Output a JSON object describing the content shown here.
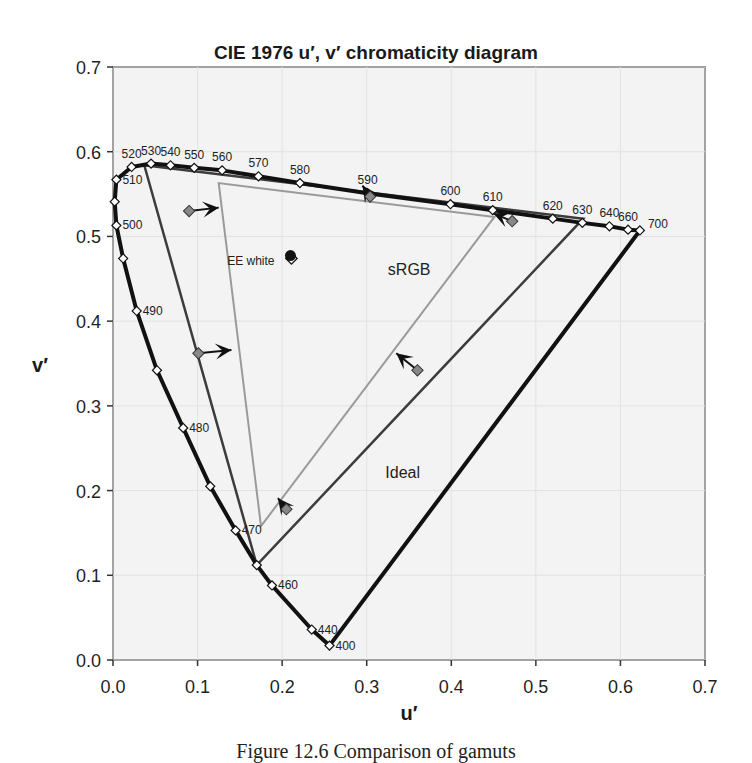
{
  "chart_data": {
    "type": "line",
    "title": "CIE 1976 u′, v′ chromaticity diagram",
    "xlabel": "u′",
    "ylabel": "v′",
    "xlim": [
      0.0,
      0.7
    ],
    "ylim": [
      0.0,
      0.7
    ],
    "x_ticks": [
      "0.0",
      "0.1",
      "0.2",
      "0.3",
      "0.4",
      "0.5",
      "0.6",
      "0.7"
    ],
    "y_ticks": [
      "0.0",
      "0.1",
      "0.2",
      "0.3",
      "0.4",
      "0.5",
      "0.6",
      "0.7"
    ],
    "grid": true,
    "spectral_locus": {
      "name": "Spectral locus",
      "points": [
        {
          "nm": 400,
          "u": 0.256,
          "v": 0.017,
          "label": "400"
        },
        {
          "nm": 440,
          "u": 0.235,
          "v": 0.036,
          "label": "440"
        },
        {
          "nm": 460,
          "u": 0.188,
          "v": 0.088,
          "label": "460"
        },
        {
          "nm": 465,
          "u": 0.17,
          "v": 0.112,
          "label": ""
        },
        {
          "nm": 470,
          "u": 0.145,
          "v": 0.153,
          "label": "470"
        },
        {
          "nm": 475,
          "u": 0.115,
          "v": 0.205,
          "label": ""
        },
        {
          "nm": 480,
          "u": 0.083,
          "v": 0.274,
          "label": "480"
        },
        {
          "nm": 485,
          "u": 0.052,
          "v": 0.342,
          "label": ""
        },
        {
          "nm": 490,
          "u": 0.028,
          "v": 0.412,
          "label": "490"
        },
        {
          "nm": 495,
          "u": 0.012,
          "v": 0.474,
          "label": ""
        },
        {
          "nm": 500,
          "u": 0.004,
          "v": 0.513,
          "label": "500"
        },
        {
          "nm": 505,
          "u": 0.002,
          "v": 0.541,
          "label": ""
        },
        {
          "nm": 510,
          "u": 0.004,
          "v": 0.567,
          "label": "510"
        },
        {
          "nm": 520,
          "u": 0.022,
          "v": 0.582,
          "label": "520"
        },
        {
          "nm": 530,
          "u": 0.045,
          "v": 0.586,
          "label": "530"
        },
        {
          "nm": 540,
          "u": 0.068,
          "v": 0.584,
          "label": "540"
        },
        {
          "nm": 550,
          "u": 0.096,
          "v": 0.581,
          "label": "550"
        },
        {
          "nm": 560,
          "u": 0.129,
          "v": 0.578,
          "label": "560"
        },
        {
          "nm": 570,
          "u": 0.172,
          "v": 0.571,
          "label": "570"
        },
        {
          "nm": 580,
          "u": 0.221,
          "v": 0.563,
          "label": "580"
        },
        {
          "nm": 590,
          "u": 0.301,
          "v": 0.551,
          "label": "590"
        },
        {
          "nm": 600,
          "u": 0.399,
          "v": 0.538,
          "label": "600"
        },
        {
          "nm": 610,
          "u": 0.449,
          "v": 0.531,
          "label": "610"
        },
        {
          "nm": 620,
          "u": 0.52,
          "v": 0.521,
          "label": "620"
        },
        {
          "nm": 630,
          "u": 0.555,
          "v": 0.516,
          "label": "630"
        },
        {
          "nm": 640,
          "u": 0.587,
          "v": 0.512,
          "label": "640"
        },
        {
          "nm": 660,
          "u": 0.609,
          "v": 0.508,
          "label": "660"
        },
        {
          "nm": 700,
          "u": 0.623,
          "v": 0.507,
          "label": "700"
        }
      ]
    },
    "gamuts": [
      {
        "name": "sRGB",
        "color": "#9a9a9a",
        "vertices": [
          {
            "u": 0.451,
            "v": 0.523
          },
          {
            "u": 0.125,
            "v": 0.563
          },
          {
            "u": 0.175,
            "v": 0.158
          }
        ]
      },
      {
        "name": "Ideal",
        "color": "#3c3c3c",
        "vertices": [
          {
            "u": 0.556,
            "v": 0.521
          },
          {
            "u": 0.037,
            "v": 0.584
          },
          {
            "u": 0.17,
            "v": 0.112
          }
        ]
      }
    ],
    "white_points": [
      {
        "name": "EE white",
        "u": 0.211,
        "v": 0.474,
        "marker": "hollow-diamond"
      },
      {
        "name": "D65",
        "u": 0.198,
        "v": 0.468,
        "marker": "filled-circle"
      }
    ],
    "arrows": [
      {
        "from": {
          "u": 0.09,
          "v": 0.53
        },
        "to": {
          "u": 0.125,
          "v": 0.534
        },
        "marker": "diamond"
      },
      {
        "from": {
          "u": 0.101,
          "v": 0.362
        },
        "to": {
          "u": 0.14,
          "v": 0.366
        },
        "marker": "diamond"
      },
      {
        "from": {
          "u": 0.472,
          "v": 0.518
        },
        "to": {
          "u": 0.45,
          "v": 0.527
        },
        "marker": "diamond"
      },
      {
        "from": {
          "u": 0.36,
          "v": 0.342
        },
        "to": {
          "u": 0.335,
          "v": 0.362
        },
        "marker": "diamond"
      },
      {
        "from": {
          "u": 0.304,
          "v": 0.547
        },
        "to": {
          "u": 0.295,
          "v": 0.56
        },
        "marker": "diamond"
      },
      {
        "from": {
          "u": 0.205,
          "v": 0.178
        },
        "to": {
          "u": 0.195,
          "v": 0.191
        },
        "marker": "diamond"
      }
    ],
    "annotations": [
      {
        "text": "sRGB",
        "u": 0.325,
        "v": 0.455
      },
      {
        "text": "Ideal",
        "u": 0.322,
        "v": 0.215
      },
      {
        "text": "EE white",
        "u": 0.135,
        "v": 0.466
      }
    ]
  },
  "caption": "Figure 12.6   Comparison of gamuts"
}
